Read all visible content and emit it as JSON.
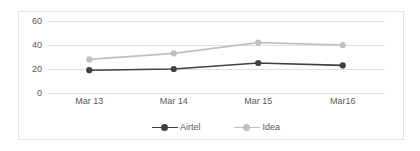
{
  "chart_data": {
    "type": "line",
    "title": "",
    "xlabel": "",
    "ylabel": "",
    "categories": [
      "Mar 13",
      "Mar 14",
      "Mar 15",
      "Mar16"
    ],
    "series": [
      {
        "name": "Airtel",
        "values": [
          19,
          20,
          25,
          23
        ],
        "color": "#404040"
      },
      {
        "name": "Idea",
        "values": [
          28,
          33,
          42,
          40
        ],
        "color": "#bfbfbf"
      }
    ],
    "yticks": [
      0,
      20,
      40,
      60
    ],
    "ytick_labels": [
      "0",
      "20",
      "40",
      "60"
    ],
    "ylim": [
      0,
      60
    ],
    "grid": true,
    "legend_position": "bottom",
    "markers": "circle"
  },
  "colors": {
    "airtel": "#404040",
    "idea": "#bfbfbf",
    "gridline": "#e0e0e0",
    "frame": "#e3e3e3",
    "text": "#595959",
    "background": "#ffffff"
  },
  "legend": {
    "entries": [
      {
        "label": "Airtel"
      },
      {
        "label": "Idea"
      }
    ]
  }
}
